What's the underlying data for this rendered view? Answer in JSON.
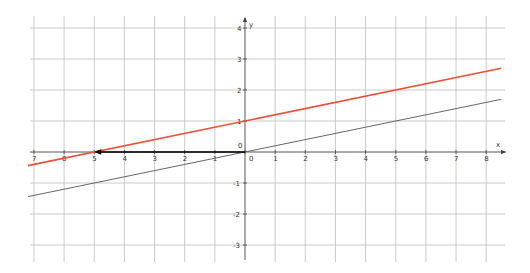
{
  "chart_data": {
    "type": "line",
    "title": "",
    "xlabel": "x",
    "ylabel": "y",
    "xlim": [
      -7.2,
      8.5
    ],
    "ylim": [
      -3.5,
      4.2
    ],
    "grid": true,
    "x_ticks": [
      -7,
      -6,
      -5,
      -4,
      -3,
      -2,
      -1,
      0,
      1,
      2,
      3,
      4,
      5,
      6,
      7,
      8
    ],
    "x_tick_labels": [
      "7",
      "6",
      "5",
      "4",
      "3",
      "2",
      "1",
      "0",
      "1",
      "2",
      "3",
      "4",
      "5",
      "6",
      "7",
      "8"
    ],
    "y_ticks": [
      -3,
      -2,
      -1,
      1,
      2,
      3,
      4
    ],
    "y_tick_labels": [
      "-3",
      "-2",
      "-1",
      "1",
      "2",
      "3",
      "4"
    ],
    "origin_label": "0",
    "series": [
      {
        "name": "y = 0.2x + 1",
        "color": "#e8503a",
        "x": [
          -7.2,
          8.5
        ],
        "y": [
          -0.44,
          2.7
        ]
      },
      {
        "name": "y = 0.2x",
        "color": "#555555",
        "x": [
          -7.2,
          8.5
        ],
        "y": [
          -1.44,
          1.7
        ]
      }
    ],
    "annotations": [
      {
        "type": "arrow",
        "from": [
          0,
          0
        ],
        "to": [
          -5,
          0
        ],
        "color": "#000000",
        "description": "horizontal shift arrow along x-axis from origin to red line x-intercept"
      }
    ]
  },
  "axis": {
    "x_label": "x",
    "y_label": "y",
    "origin": "0"
  }
}
